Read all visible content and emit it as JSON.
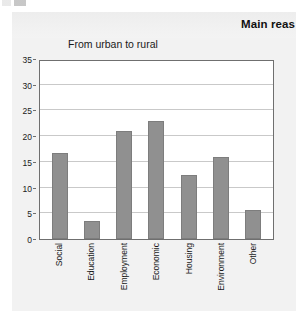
{
  "page": {
    "main_heading": "Main reas",
    "top_artifact": "cropped-text-fragment"
  },
  "chart_data": {
    "type": "bar",
    "title": "From urban to rural",
    "xlabel": "",
    "ylabel": "",
    "categories": [
      "Social",
      "Education",
      "Employment",
      "Economic",
      "Housing",
      "Environment",
      "Other"
    ],
    "values": [
      16.7,
      3.5,
      21.0,
      23.0,
      12.5,
      16.0,
      5.6
    ],
    "ylim": [
      0,
      35
    ],
    "yticks": [
      0,
      5,
      10,
      15,
      20,
      25,
      30,
      35
    ],
    "ytick_labels": [
      "0",
      "5",
      "10",
      "15",
      "20",
      "25",
      "30",
      "35"
    ],
    "grid": true,
    "legend": false,
    "bar_color": "#909090",
    "bar_border_color": "#7d7d7d",
    "plot_background": "#ffffff",
    "panel_background": "#f2f2f2",
    "axis_color": "#6f6f6f",
    "gridline_color": "#c9c9c9"
  }
}
